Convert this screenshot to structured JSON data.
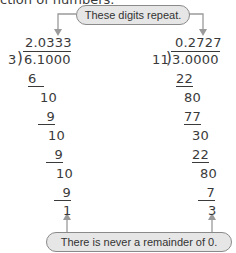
{
  "header": {
    "cut_text": "ction of numbers."
  },
  "callouts": {
    "top": "These digits repeat.",
    "bottom": "There is never a remainder of 0."
  },
  "left_division": {
    "divisor": "3",
    "dividend": "6.1000",
    "quotient": "2.0333",
    "steps": [
      "6",
      "10",
      "9",
      "10",
      "9",
      "10",
      "9",
      "1"
    ]
  },
  "right_division": {
    "divisor": "11",
    "dividend": "3.0000",
    "quotient": "0.2727",
    "steps": [
      "22",
      "80",
      "77",
      "30",
      "22",
      "80",
      "7",
      "3"
    ]
  },
  "colors": {
    "callout_fill": "#e6e6e6",
    "callout_border": "#8a8a8a",
    "arrow": "#9a9a9a",
    "text": "#3a3a3a"
  }
}
